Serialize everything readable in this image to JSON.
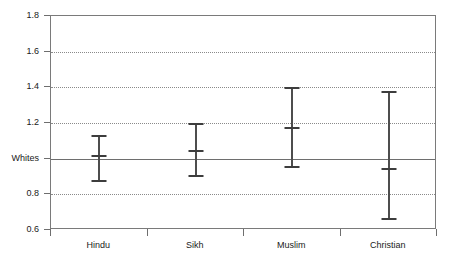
{
  "chart_data": {
    "type": "scatter",
    "title": "",
    "subtitle": "",
    "xlabel": "",
    "ylabel": "",
    "categories": [
      "Hindu",
      "Sikh",
      "Muslim",
      "Christian"
    ],
    "values": [
      1.02,
      1.05,
      1.18,
      0.95
    ],
    "error_low": [
      0.88,
      0.91,
      0.96,
      0.67
    ],
    "error_high": [
      1.13,
      1.2,
      1.4,
      1.38
    ],
    "series": [
      {
        "name": "Odds ratio vs Whites",
        "points": [
          {
            "category": "Hindu",
            "value": 1.02,
            "low": 0.88,
            "high": 1.13
          },
          {
            "category": "Sikh",
            "value": 1.05,
            "low": 0.91,
            "high": 1.2
          },
          {
            "category": "Muslim",
            "value": 1.18,
            "low": 0.96,
            "high": 1.4
          },
          {
            "category": "Christian",
            "value": 0.95,
            "low": 0.67,
            "high": 1.38
          }
        ]
      }
    ],
    "ylim": [
      0.6,
      1.8
    ],
    "ytick_values": [
      1.8,
      1.6,
      1.4,
      1.2,
      1.0,
      0.8,
      0.6
    ],
    "ytick_labels": [
      "1.8",
      "1.6",
      "1.4",
      "1.2",
      "Whites",
      "0.8",
      "0.6"
    ],
    "reference_line": {
      "value": 1.0,
      "label": "Whites"
    },
    "grid": "horizontal-dotted",
    "legend": "none",
    "annotations": []
  }
}
